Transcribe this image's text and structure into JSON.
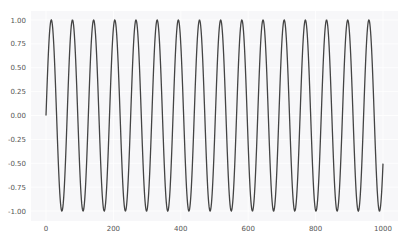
{
  "chart_data": {
    "type": "line",
    "title": "",
    "xlabel": "",
    "ylabel": "",
    "function": "y = sin(0.1 * x)",
    "x_range": [
      0,
      1000
    ],
    "xlim": [
      -45,
      1045
    ],
    "ylim": [
      -1.1,
      1.1
    ],
    "xticks": [
      0,
      200,
      400,
      600,
      800,
      1000
    ],
    "xtick_labels": [
      "0",
      "200",
      "400",
      "600",
      "800",
      "1000"
    ],
    "yticks": [
      1.0,
      0.75,
      0.5,
      0.25,
      0.0,
      -0.25,
      -0.5,
      -0.75,
      -1.0
    ],
    "ytick_labels": [
      "1.00",
      "0.75",
      "0.50",
      "0.25",
      "0.00",
      "-0.25",
      "-0.50",
      "-0.75",
      "-1.00"
    ],
    "grid": true,
    "legend": null,
    "series": [
      {
        "name": "sin",
        "color": "#444444",
        "start": {
          "x": 0,
          "y": 0.0
        },
        "end": {
          "x": 1000,
          "y": -0.506
        },
        "period": 62.83,
        "cycles": 15.9,
        "amplitude": 1.0
      }
    ]
  },
  "style": {
    "plot_bg": "#f7f7f9",
    "grid_color": "#ffffff",
    "line_color": "#444444",
    "label_color": "#555555"
  }
}
